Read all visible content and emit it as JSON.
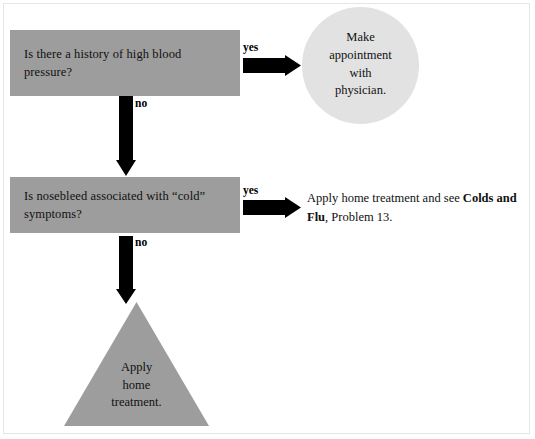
{
  "diagram": {
    "title_text": "Nosebleed decision flowchart",
    "colors": {
      "question_box_fill": "#9d9d9d",
      "circle_fill": "#e2e2e2",
      "triangle_fill": "#9d9d9d",
      "arrow_fill": "#000000",
      "text": "#111111",
      "page_background": "#ffffff"
    },
    "nodes": {
      "question1": {
        "label_line1": "Is there a history of high blood",
        "label_line2": "pressure?",
        "shape": "rectangle"
      },
      "question2": {
        "label_line1": "Is nosebleed associated with “cold”",
        "label_line2": "symptoms?",
        "shape": "rectangle"
      },
      "outcome_circle": {
        "line1": "Make",
        "line2": "appointment",
        "line3": "with",
        "line4": "physician.",
        "shape": "circle"
      },
      "outcome_triangle": {
        "line1": "Apply",
        "line2": "home",
        "line3": "treatment.",
        "shape": "triangle"
      },
      "outcome_text": {
        "part1": "Apply home treatment and see ",
        "bold1": "Colds",
        "bold2": "and Flu",
        "part2": ", Problem 13."
      }
    },
    "edges": {
      "yes1": "yes",
      "no1": "no",
      "yes2": "yes",
      "no2": "no"
    }
  }
}
